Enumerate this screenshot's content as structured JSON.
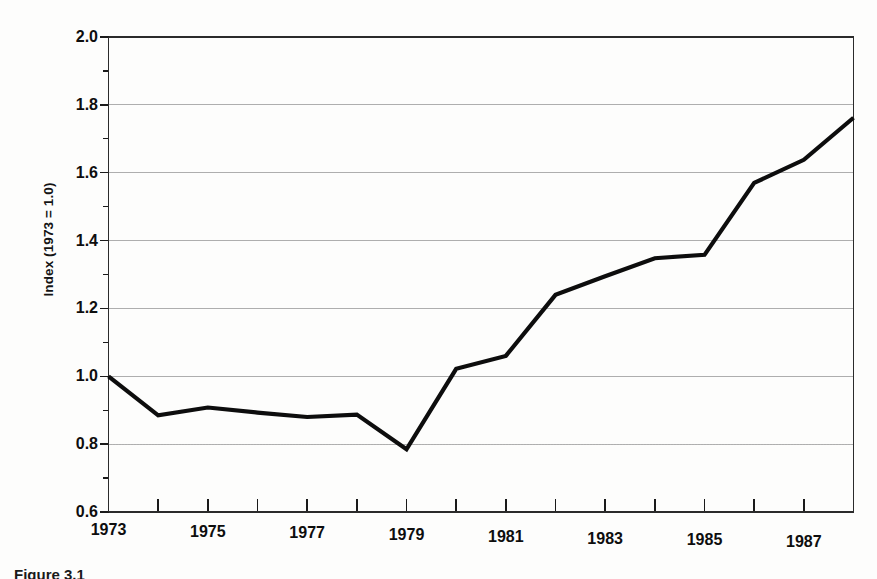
{
  "chart_data": {
    "type": "line",
    "title": "",
    "xlabel": "",
    "ylabel": "Index (1973 = 1.0)",
    "xlim": [
      1973,
      1988
    ],
    "ylim": [
      0.6,
      2.0
    ],
    "ytick_values": [
      2.0,
      1.8,
      1.6,
      1.4,
      1.2,
      1.0,
      0.8,
      0.6
    ],
    "ytick_labels": [
      "2.0",
      "1.8",
      "1.6",
      "1.4",
      "1.2",
      "1.0",
      "0.8",
      "0.6"
    ],
    "yminor_values": [
      1.9,
      1.7,
      1.5,
      1.3,
      1.1,
      0.9,
      0.7
    ],
    "xtick_values": [
      1973,
      1974,
      1975,
      1976,
      1977,
      1978,
      1979,
      1980,
      1981,
      1982,
      1983,
      1984,
      1985,
      1986,
      1987,
      1988
    ],
    "xtick_labels_shown": [
      "1973",
      "1975",
      "1977",
      "1979",
      "1981",
      "1983",
      "1985",
      "1987"
    ],
    "xtick_labeled_values": [
      1973,
      1975,
      1977,
      1979,
      1981,
      1983,
      1985,
      1987
    ],
    "grid": "horizontal-major",
    "legend": "none",
    "line_color": "#0d0d0d",
    "line_width": 4.2,
    "x": [
      1973,
      1974,
      1975,
      1976,
      1977,
      1978,
      1979,
      1980,
      1981,
      1982,
      1983,
      1984,
      1985,
      1986,
      1987,
      1988
    ],
    "values": [
      1.0,
      0.885,
      0.908,
      0.893,
      0.88,
      0.887,
      0.785,
      1.022,
      1.06,
      1.24,
      1.295,
      1.348,
      1.358,
      1.57,
      1.638,
      1.762
    ],
    "series": [
      {
        "name": "Index (1973 = 1.0)",
        "values": [
          1.0,
          0.885,
          0.908,
          0.893,
          0.88,
          0.887,
          0.785,
          1.022,
          1.06,
          1.24,
          1.295,
          1.348,
          1.358,
          1.57,
          1.638,
          1.762
        ]
      }
    ]
  },
  "axes": {
    "y_title": "Index (1973 = 1.0)",
    "y_labels": [
      "2.0",
      "1.8",
      "1.6",
      "1.4",
      "1.2",
      "1.0",
      "0.8",
      "0.6"
    ],
    "x_labels": [
      "1973",
      "1975",
      "1977",
      "1979",
      "1981",
      "1983",
      "1985",
      "1987"
    ]
  },
  "caption": {
    "text": "Figure 3.1"
  }
}
